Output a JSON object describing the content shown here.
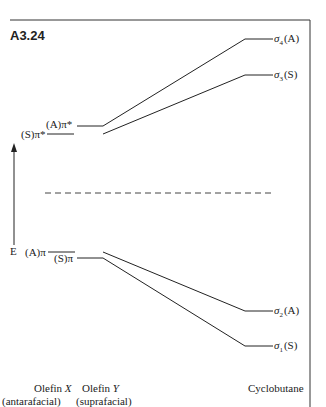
{
  "figure": {
    "id": "A3.24",
    "axis_label": "E",
    "levels_left": {
      "A_pi_star": "(A)π*",
      "S_pi_star": "(S)π*",
      "A_pi": "(A)π",
      "S_pi": "(S)π"
    },
    "levels_right": {
      "sigma4": {
        "sym": "σ",
        "sub": "4",
        "tag": "(A)"
      },
      "sigma3": {
        "sym": "σ",
        "sub": "3",
        "tag": "(S)"
      },
      "sigma2": {
        "sym": "σ",
        "sub": "2",
        "tag": "(A)"
      },
      "sigma1": {
        "sym": "σ",
        "sub": "1",
        "tag": "(S)"
      }
    },
    "captions": {
      "olefin_x_line1": "Olefin ",
      "olefin_x_var": "X",
      "olefin_x_line2": "(antarafacial)",
      "olefin_y_line1": "Olefin ",
      "olefin_y_var": "Y",
      "olefin_y_line2": "(suprafacial)",
      "product": "Cyclobutane"
    },
    "colors": {
      "ink": "#222222",
      "background": "#ffffff"
    }
  }
}
